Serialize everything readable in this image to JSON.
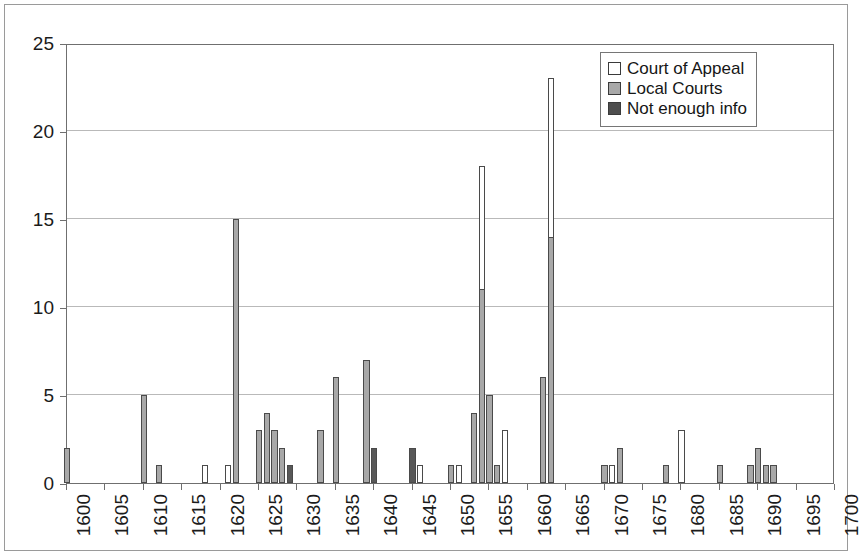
{
  "chart_data": {
    "type": "bar",
    "stacked": true,
    "title": "",
    "subtitle": "",
    "xlabel": "",
    "ylabel": "",
    "xlim": [
      1600,
      1700
    ],
    "ylim": [
      0,
      25
    ],
    "ytick_values": [
      0,
      5,
      10,
      15,
      20,
      25
    ],
    "ytick_labels": [
      "0",
      "5",
      "10",
      "15",
      "20",
      "25"
    ],
    "xtick_values": [
      1600,
      1605,
      1610,
      1615,
      1620,
      1625,
      1630,
      1635,
      1640,
      1645,
      1650,
      1655,
      1660,
      1665,
      1670,
      1675,
      1680,
      1685,
      1690,
      1695,
      1700
    ],
    "xtick_labels": [
      "1600",
      "1605",
      "1610",
      "1615",
      "1620",
      "1625",
      "1630",
      "1635",
      "1640",
      "1645",
      "1650",
      "1655",
      "1660",
      "1665",
      "1670",
      "1675",
      "1680",
      "1685",
      "1690",
      "1695",
      "1700"
    ],
    "xtick_rotation": 90,
    "grid": "horizontal",
    "legend_position": "top-right",
    "colors": {
      "court_of_appeal": "#ffffff",
      "local_courts": "#a8a8a8",
      "not_enough_info": "#4e4e4e",
      "bar_outline": "#4a4a4a",
      "gridline": "#b9b9b9",
      "axis": "#6f6f6f",
      "text": "#1b1b1b",
      "background": "#ffffff"
    },
    "series": [
      {
        "name": "Court of Appeal",
        "key": "appeal"
      },
      {
        "name": "Local Courts",
        "key": "local"
      },
      {
        "name": "Not enough info",
        "key": "noinfo"
      }
    ],
    "bars": [
      {
        "year": 1600,
        "local": 2,
        "appeal": 0,
        "noinfo": 0,
        "total": 2
      },
      {
        "year": 1610,
        "local": 5,
        "appeal": 0,
        "noinfo": 0,
        "total": 5
      },
      {
        "year": 1612,
        "local": 1,
        "appeal": 0,
        "noinfo": 0,
        "total": 1
      },
      {
        "year": 1618,
        "local": 0,
        "appeal": 1,
        "noinfo": 0,
        "total": 1
      },
      {
        "year": 1621,
        "local": 0,
        "appeal": 1,
        "noinfo": 0,
        "total": 1
      },
      {
        "year": 1622,
        "local": 15,
        "appeal": 0,
        "noinfo": 0,
        "total": 15
      },
      {
        "year": 1625,
        "local": 3,
        "appeal": 0,
        "noinfo": 0,
        "total": 3
      },
      {
        "year": 1626,
        "local": 4,
        "appeal": 0,
        "noinfo": 0,
        "total": 4
      },
      {
        "year": 1627,
        "local": 3,
        "appeal": 0,
        "noinfo": 0,
        "total": 3
      },
      {
        "year": 1628,
        "local": 2,
        "appeal": 0,
        "noinfo": 0,
        "total": 2
      },
      {
        "year": 1629,
        "local": 0,
        "appeal": 0,
        "noinfo": 1,
        "total": 1
      },
      {
        "year": 1633,
        "local": 3,
        "appeal": 0,
        "noinfo": 0,
        "total": 3
      },
      {
        "year": 1635,
        "local": 6,
        "appeal": 0,
        "noinfo": 0,
        "total": 6
      },
      {
        "year": 1639,
        "local": 7,
        "appeal": 0,
        "noinfo": 0,
        "total": 7
      },
      {
        "year": 1640,
        "local": 0,
        "appeal": 0,
        "noinfo": 2,
        "total": 2
      },
      {
        "year": 1645,
        "local": 0,
        "appeal": 0,
        "noinfo": 2,
        "total": 2
      },
      {
        "year": 1646,
        "local": 0,
        "appeal": 1,
        "noinfo": 0,
        "total": 1
      },
      {
        "year": 1650,
        "local": 1,
        "appeal": 0,
        "noinfo": 0,
        "total": 1
      },
      {
        "year": 1651,
        "local": 0,
        "appeal": 1,
        "noinfo": 0,
        "total": 1
      },
      {
        "year": 1653,
        "local": 4,
        "appeal": 0,
        "noinfo": 0,
        "total": 4
      },
      {
        "year": 1654,
        "local": 11,
        "appeal": 7,
        "noinfo": 0,
        "total": 18
      },
      {
        "year": 1655,
        "local": 5,
        "appeal": 0,
        "noinfo": 0,
        "total": 5
      },
      {
        "year": 1656,
        "local": 1,
        "appeal": 0,
        "noinfo": 0,
        "total": 1
      },
      {
        "year": 1657,
        "local": 0,
        "appeal": 3,
        "noinfo": 0,
        "total": 3
      },
      {
        "year": 1662,
        "local": 6,
        "appeal": 0,
        "noinfo": 0,
        "total": 6
      },
      {
        "year": 1663,
        "local": 14,
        "appeal": 9,
        "noinfo": 0,
        "total": 23
      },
      {
        "year": 1670,
        "local": 1,
        "appeal": 0,
        "noinfo": 0,
        "total": 1
      },
      {
        "year": 1671,
        "local": 0,
        "appeal": 1,
        "noinfo": 0,
        "total": 1
      },
      {
        "year": 1672,
        "local": 2,
        "appeal": 0,
        "noinfo": 0,
        "total": 2
      },
      {
        "year": 1678,
        "local": 1,
        "appeal": 0,
        "noinfo": 0,
        "total": 1
      },
      {
        "year": 1680,
        "local": 0,
        "appeal": 3,
        "noinfo": 0,
        "total": 3
      },
      {
        "year": 1685,
        "local": 1,
        "appeal": 0,
        "noinfo": 0,
        "total": 1
      },
      {
        "year": 1689,
        "local": 1,
        "appeal": 0,
        "noinfo": 0,
        "total": 1
      },
      {
        "year": 1690,
        "local": 2,
        "appeal": 0,
        "noinfo": 0,
        "total": 2
      },
      {
        "year": 1691,
        "local": 1,
        "appeal": 0,
        "noinfo": 0,
        "total": 1
      },
      {
        "year": 1692,
        "local": 1,
        "appeal": 0,
        "noinfo": 0,
        "total": 1
      }
    ]
  },
  "legend": {
    "items": [
      {
        "label": "Court of Appeal",
        "key": "appeal"
      },
      {
        "label": "Local Courts",
        "key": "local"
      },
      {
        "label": "Not enough info",
        "key": "noinfo"
      }
    ]
  }
}
